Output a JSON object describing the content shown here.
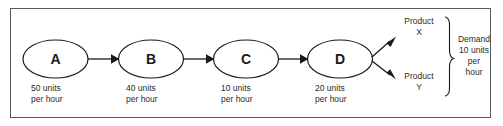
{
  "diagram": {
    "frame": {
      "border_color": "#5a5a5a"
    },
    "nodes": [
      {
        "id": "A",
        "label": "A",
        "capacity_line1": "50 units",
        "capacity_line2": "per hour"
      },
      {
        "id": "B",
        "label": "B",
        "capacity_line1": "40 units",
        "capacity_line2": "per hour"
      },
      {
        "id": "C",
        "label": "C",
        "capacity_line1": "10 units",
        "capacity_line2": "per hour"
      },
      {
        "id": "D",
        "label": "D",
        "capacity_line1": "20 units",
        "capacity_line2": "per hour"
      }
    ],
    "outputs": [
      {
        "id": "X",
        "line1": "Product",
        "line2": "X"
      },
      {
        "id": "Y",
        "line1": "Product",
        "line2": "Y"
      }
    ],
    "demand": {
      "line1": "Demand",
      "line2": "10 units",
      "line3": "per",
      "line4": "hour"
    },
    "colors": {
      "stroke": "#1a1a1a",
      "text": "#2b2b2b",
      "background": "#ffffff"
    }
  }
}
